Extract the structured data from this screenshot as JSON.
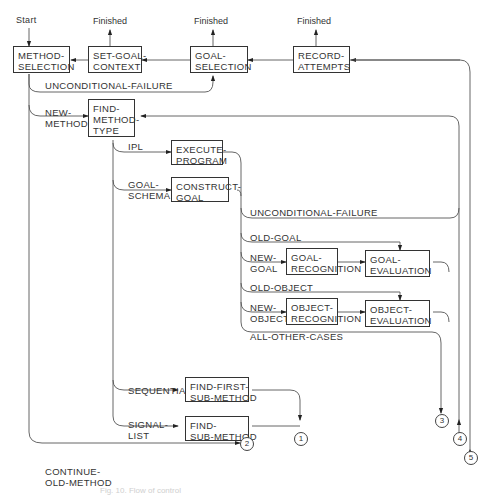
{
  "start_label": "Start",
  "finished_label": "Finished",
  "boxes": {
    "method_selection": "METHOD-\nSELECTION",
    "set_goal_context": "SET-GOAL-\nCONTEXT",
    "goal_selection": "GOAL-\nSELECTION",
    "record_attempts": "RECORD-\nATTEMPTS",
    "find_method_type": "FIND-\nMETHOD-\nTYPE",
    "execute_program": "EXECUTE-\nPROGRAM",
    "construct_goal": "CONSTRUCT-\nGOAL",
    "goal_recognition": "GOAL-\nRECOGNITION",
    "goal_evaluation": "GOAL-\nEVALUATION",
    "object_recognition": "OBJECT-\nRECOGNITION",
    "object_evaluation": "OBJECT-\nEVALUATION",
    "find_first_sub_method": "FIND-FIRST-\nSUB-METHOD",
    "find_sub_method": "FIND-\nSUB-METHOD"
  },
  "edge_labels": {
    "unconditional_failure_1": "UNCONDITIONAL-FAILURE",
    "new_method": "NEW-\nMETHOD",
    "ipl": "IPL",
    "goal_schema": "GOAL-\nSCHEMA",
    "unconditional_failure_2": "UNCONDITIONAL-FAILURE",
    "old_goal": "OLD-GOAL",
    "new_goal": "NEW-\nGOAL",
    "old_object": "OLD-OBJECT",
    "new_object": "NEW-\nOBJECT",
    "all_other_cases": "ALL-OTHER-CASES",
    "sequential": "SEQUENTIAL",
    "signal_list": "SIGNAL-\nLIST",
    "continue_old_method": "CONTINUE-\nOLD-METHOD"
  },
  "connectors": [
    "1",
    "2",
    "3",
    "4",
    "5"
  ],
  "caption": "Fig. 10.  Flow of control"
}
